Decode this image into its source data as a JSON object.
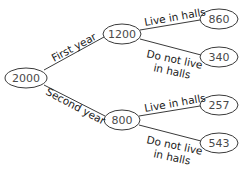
{
  "tree": {
    "root": {
      "value": "2000"
    },
    "branches": [
      {
        "label": "First year",
        "value": "1200",
        "children": [
          {
            "label": "Live in halls",
            "value": "860"
          },
          {
            "label_line1": "Do not live",
            "label_line2": "in halls",
            "value": "340"
          }
        ]
      },
      {
        "label": "Second year",
        "value": "800",
        "children": [
          {
            "label": "Live in halls",
            "value": "257"
          },
          {
            "label_line1": "Do not live",
            "label_line2": "in halls",
            "value": "543"
          }
        ]
      }
    ]
  },
  "colors": {
    "stroke": "#3a3a3a",
    "node_text": "#4a4a4a",
    "edge_text": "#1a1a1a",
    "background": "#ffffff"
  }
}
